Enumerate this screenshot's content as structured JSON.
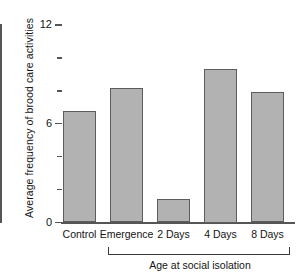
{
  "chart_data": {
    "type": "bar",
    "title": "",
    "xlabel": "Age at social isolation",
    "ylabel": "Average frequency of brood care activities",
    "categories": [
      "Control",
      "Emergence",
      "2 Days",
      "4 Days",
      "8 Days"
    ],
    "values": [
      6.8,
      8.2,
      1.4,
      9.3,
      7.9
    ],
    "ylim": [
      0,
      12
    ],
    "yticks_major": [
      0,
      6,
      12
    ],
    "yticks_major_labels": [
      "0",
      "6",
      "12"
    ],
    "yticks_minor": [
      2,
      4,
      8,
      10
    ],
    "grid": false,
    "legend": null,
    "bar_color": "#b2b2b2",
    "bar_edge_color": "#5d5d5d",
    "axis_color": "#555555",
    "group_bracket_categories": [
      "Emergence",
      "2 Days",
      "4 Days",
      "8 Days"
    ]
  },
  "axes": {
    "y_title": "Average frequency of brood care activities",
    "x_group_title": "Age at social isolation"
  }
}
